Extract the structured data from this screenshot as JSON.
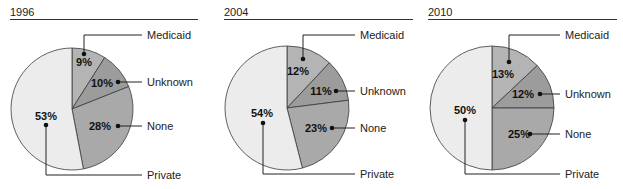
{
  "chart_data": [
    {
      "type": "pie",
      "title": "1996",
      "categories": [
        "Medicaid",
        "Unknown",
        "None",
        "Private"
      ],
      "values": [
        9,
        10,
        28,
        53
      ],
      "labels": [
        "9%",
        "10%",
        "28%",
        "53%"
      ],
      "start_angle": "12 o'clock, clockwise",
      "colors": [
        "#b4b4b4",
        "#9c9c9c",
        "#a9a9a9",
        "#ececec"
      ]
    },
    {
      "type": "pie",
      "title": "2004",
      "categories": [
        "Medicaid",
        "Unknown",
        "None",
        "Private"
      ],
      "values": [
        12,
        11,
        23,
        54
      ],
      "labels": [
        "12%",
        "11%",
        "23%",
        "54%"
      ],
      "start_angle": "12 o'clock, clockwise",
      "colors": [
        "#b4b4b4",
        "#9c9c9c",
        "#a9a9a9",
        "#ececec"
      ]
    },
    {
      "type": "pie",
      "title": "2010",
      "categories": [
        "Medicaid",
        "Unknown",
        "None",
        "Private"
      ],
      "values": [
        13,
        12,
        25,
        50
      ],
      "labels": [
        "13%",
        "12%",
        "25%",
        "50%"
      ],
      "start_angle": "12 o'clock, clockwise",
      "colors": [
        "#b4b4b4",
        "#9c9c9c",
        "#a9a9a9",
        "#ececec"
      ]
    }
  ],
  "panels": [
    {
      "title": "1996",
      "legend": {
        "medicaid": "Medicaid",
        "unknown": "Unknown",
        "none": "None",
        "private": "Private"
      },
      "pct": {
        "medicaid": "9%",
        "unknown": "10%",
        "none": "28%",
        "private": "53%"
      }
    },
    {
      "title": "2004",
      "legend": {
        "medicaid": "Medicaid",
        "unknown": "Unknown",
        "none": "None",
        "private": "Private"
      },
      "pct": {
        "medicaid": "12%",
        "unknown": "11%",
        "none": "23%",
        "private": "54%"
      }
    },
    {
      "title": "2010",
      "legend": {
        "medicaid": "Medicaid",
        "unknown": "Unknown",
        "none": "None",
        "private": "Private"
      },
      "pct": {
        "medicaid": "13%",
        "unknown": "12%",
        "none": "25%",
        "private": "50%"
      }
    }
  ],
  "style": {
    "outline": "#3a3a3a",
    "leader": "#222222",
    "colors": {
      "medicaid": "#b4b4b4",
      "unknown": "#9c9c9c",
      "none": "#a9a9a9",
      "private": "#ececec"
    }
  }
}
